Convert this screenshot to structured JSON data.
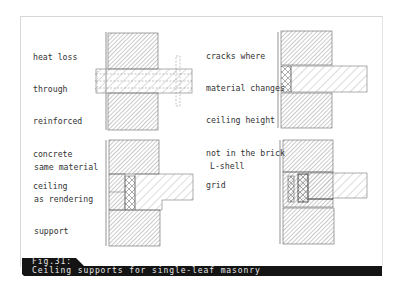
{
  "figure": {
    "number_label": "Fig.31:",
    "caption": "Ceiling supports for single-leaf masonry"
  },
  "panels": [
    {
      "id": "top-left",
      "label_lines": [
        "heat loss",
        "through",
        "reinforced",
        "concrete",
        "ceiling"
      ]
    },
    {
      "id": "top-right",
      "label_lines": [
        "cracks where",
        "material changes",
        "ceiling height",
        "not in the brick",
        "grid"
      ]
    },
    {
      "id": "bottom-left",
      "label_lines": [
        "same material",
        "as rendering",
        "support"
      ]
    },
    {
      "id": "bottom-right",
      "label_lines": [
        "L-shell"
      ]
    }
  ],
  "colors": {
    "caption_bg": "#141414",
    "caption_text": "#e8e8e8",
    "line": "#555555",
    "hatch": "#888888"
  }
}
